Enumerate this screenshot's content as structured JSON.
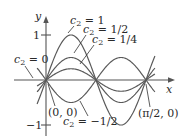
{
  "chart_data": {
    "type": "line",
    "title": "",
    "function": "y = c2 sin(4x)",
    "xlabel": "x",
    "ylabel": "y",
    "xlim": [
      0,
      1.5708
    ],
    "ylim": [
      -1,
      1
    ],
    "y_ticks": [
      {
        "value": 1,
        "label": "1"
      },
      {
        "value": -1,
        "label": "−1"
      }
    ],
    "grid": false,
    "legend": "inline-annotations",
    "series": [
      {
        "name": "c2 = 1",
        "c2": 1
      },
      {
        "name": "c2 = 1/2",
        "c2": 0.5
      },
      {
        "name": "c2 = 1/4",
        "c2": 0.25
      },
      {
        "name": "c2 = 0",
        "c2": 0
      },
      {
        "name": "c2 = −1/2",
        "c2": -0.5
      }
    ],
    "annotations": [
      {
        "text": "(0, 0)",
        "x": 0,
        "y": 0
      },
      {
        "text": "(π/2, 0)",
        "x": 1.5708,
        "y": 0
      }
    ]
  },
  "labels": {
    "y_axis": "y",
    "x_axis": "x",
    "tick_pos": "1",
    "tick_neg": "−1",
    "c_prefix": "c",
    "c_sub": "2",
    "c1_value": " = 1",
    "c_half_value": " = 1/2",
    "c_quarter_value": " = 1/4",
    "c_zero_value": " = 0",
    "c_neg_half_value": " = −1/2",
    "origin_point": "(0, 0)",
    "end_point": "(π/2, 0)"
  }
}
